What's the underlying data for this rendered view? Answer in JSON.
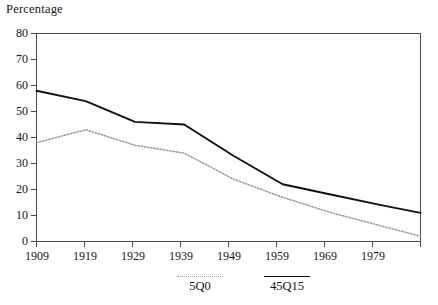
{
  "chart_data": {
    "type": "line",
    "title": "",
    "ylabel": "Percentage",
    "xlabel": "",
    "ylim": [
      0,
      80
    ],
    "xlim": [
      1909,
      1987
    ],
    "grid": false,
    "legend_position": "bottom",
    "y_ticks": [
      "80",
      "70",
      "60",
      "50",
      "40",
      "30",
      "20",
      "10",
      "0"
    ],
    "y_tick_values": [
      80,
      70,
      60,
      50,
      40,
      30,
      20,
      10,
      0
    ],
    "x_ticks": [
      "1909",
      "1919",
      "1929",
      "1939",
      "1949",
      "1959",
      "1969",
      "1979"
    ],
    "x_tick_values": [
      1909,
      1919,
      1929,
      1939,
      1949,
      1959,
      1969,
      1979
    ],
    "categories": [
      1909,
      1919,
      1929,
      1939,
      1949,
      1959,
      1969,
      1979,
      1987
    ],
    "series": [
      {
        "name": "45Q15",
        "style": "solid",
        "color": "#111111",
        "values": [
          58,
          54,
          46,
          45,
          33,
          22,
          18,
          14,
          11
        ]
      },
      {
        "name": "5Q0",
        "style": "dotted",
        "color": "#9a9a9a",
        "values": [
          38,
          43,
          37,
          34,
          24,
          17,
          11,
          6,
          2
        ]
      }
    ]
  },
  "legend": {
    "entries": [
      {
        "label": "5Q0",
        "style": "dotted"
      },
      {
        "label": "45Q15",
        "style": "solid"
      }
    ]
  },
  "colors": {
    "solid_line": "#111111",
    "dotted_line": "#9a9a9a",
    "axis": "#4a4a4a",
    "text": "#151515",
    "background": "#ffffff"
  }
}
